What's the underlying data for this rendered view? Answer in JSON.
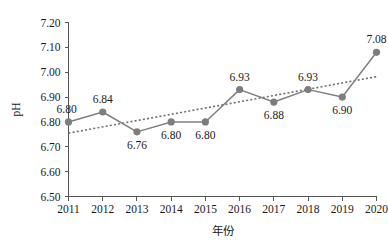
{
  "chart_data": {
    "type": "line",
    "title": "",
    "subtitle": "",
    "xlabel": "年份",
    "ylabel": "pH",
    "categories": [
      "2011",
      "2012",
      "2013",
      "2014",
      "2015",
      "2016",
      "2017",
      "2018",
      "2019",
      "2020"
    ],
    "x": [
      2011,
      2012,
      2013,
      2014,
      2015,
      2016,
      2017,
      2018,
      2019,
      2020
    ],
    "values": [
      6.8,
      6.84,
      6.76,
      6.8,
      6.8,
      6.93,
      6.88,
      6.93,
      6.9,
      7.08
    ],
    "point_labels": [
      "6.80",
      "6.84",
      "6.76",
      "6.80",
      "6.80",
      "6.93",
      "6.88",
      "6.93",
      "6.90",
      "7.08"
    ],
    "label_positions": [
      "above",
      "above",
      "below",
      "below",
      "below",
      "above",
      "below",
      "above",
      "below",
      "above"
    ],
    "ylim": [
      6.5,
      7.2
    ],
    "ytick_step": 0.1,
    "ytick_labels": [
      "6.50",
      "6.60",
      "6.70",
      "6.80",
      "6.90",
      "7.00",
      "7.10",
      "7.20"
    ],
    "ytick_values": [
      6.5,
      6.6,
      6.7,
      6.8,
      6.9,
      7.0,
      7.1,
      7.2
    ],
    "grid": false,
    "legend": false,
    "legend_position": "none",
    "series": [
      {
        "name": "pH",
        "values": [
          6.8,
          6.84,
          6.76,
          6.8,
          6.8,
          6.93,
          6.88,
          6.93,
          6.9,
          7.08
        ],
        "style": "solid-line-with-round-markers",
        "color": "#808080"
      },
      {
        "name": "trendline",
        "start_value": 6.755,
        "end_value": 6.982,
        "style": "dotted",
        "color": "#6e6e6e"
      }
    ],
    "colors": {
      "series_line": "#808080",
      "marker": "#7d7d7d",
      "trendline": "#6e6e6e",
      "axis": "#555555",
      "text": "#1a1a1a",
      "background": "#ffffff"
    }
  }
}
